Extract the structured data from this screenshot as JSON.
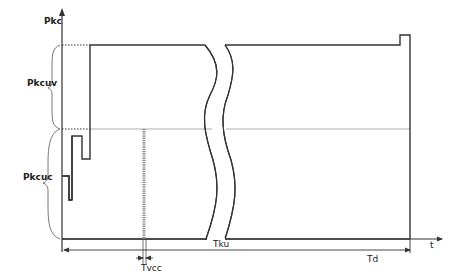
{
  "diagram": {
    "type": "timing-waveform",
    "axes": {
      "y_label": "Pkc",
      "x_label": "t"
    },
    "brackets": [
      {
        "label": "Pkcuv",
        "from_level": "high",
        "to_level": "mid"
      },
      {
        "label": "Pkcuc",
        "from_level": "mid",
        "to_level": "baseline"
      }
    ],
    "dimensions": [
      {
        "label": "Tku",
        "description": "span from y-axis to end of waveform"
      },
      {
        "label": "Tvcc",
        "description": "narrow interval at dotted vertical marker"
      },
      {
        "label": "Td",
        "description": "end marker of duration"
      }
    ],
    "features": {
      "break_marks": 2,
      "dotted_marker": "vertical dotted line between mid level and baseline",
      "final_step": "small step up before final fall to baseline"
    },
    "colors": {
      "stroke": "#333333",
      "guide": "#999999",
      "background": "#ffffff"
    }
  }
}
